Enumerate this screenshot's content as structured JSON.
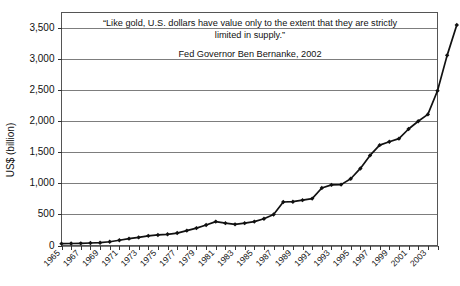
{
  "chart_data": {
    "type": "line",
    "title": "",
    "xlabel": "",
    "ylabel": "US$ (billion)",
    "ylim": [
      0,
      3750
    ],
    "xlim": [
      1965,
      2004
    ],
    "grid": true,
    "legend": false,
    "marker": "diamond",
    "series_name": "US money supply / debt outstanding",
    "annotations": {
      "quote_line_1": "“Like gold, U.S. dollars have value only to the extent that they are strictly",
      "quote_line_2": "limited in supply.”",
      "attribution": "Fed Governor Ben Bernanke, 2002"
    },
    "ytick_labels": [
      "0",
      "500",
      "1,000",
      "1,500",
      "2,000",
      "2,500",
      "3,000",
      "3,500"
    ],
    "ytick_values": [
      0,
      500,
      1000,
      1500,
      2000,
      2500,
      3000,
      3500
    ],
    "xtick_labels": [
      "1965",
      "1967",
      "1969",
      "1971",
      "1973",
      "1975",
      "1977",
      "1979",
      "1981",
      "1983",
      "1985",
      "1987",
      "1989",
      "1991",
      "1993",
      "1995",
      "1997",
      "1999",
      "2001",
      "2003"
    ],
    "x": [
      1965,
      1966,
      1967,
      1968,
      1969,
      1970,
      1971,
      1972,
      1973,
      1974,
      1975,
      1976,
      1977,
      1978,
      1979,
      1980,
      1981,
      1982,
      1983,
      1984,
      1985,
      1986,
      1987,
      1988,
      1989,
      1990,
      1991,
      1992,
      1993,
      1994,
      1995,
      1996,
      1997,
      1998,
      1999,
      2000,
      2001,
      2002,
      2003,
      2004
    ],
    "values": [
      30,
      32,
      35,
      40,
      45,
      60,
      85,
      110,
      130,
      155,
      170,
      180,
      200,
      240,
      280,
      330,
      385,
      360,
      340,
      360,
      385,
      430,
      500,
      700,
      705,
      730,
      755,
      925,
      975,
      980,
      1075,
      1240,
      1450,
      1615,
      1670,
      1720,
      1875,
      2000,
      2110,
      2490
    ],
    "values_tail_note": "final steep segment",
    "colors": {
      "line": "#111111",
      "marker": "#111111",
      "grid": "#7d7d7d",
      "frame": "#555555",
      "background": "#ffffff"
    }
  }
}
